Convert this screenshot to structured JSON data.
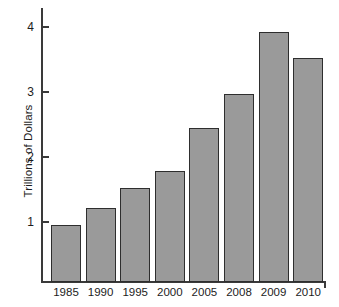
{
  "chart_data": {
    "type": "bar",
    "title": "",
    "subtitle": "",
    "xlabel": "",
    "ylabel": "Trillions of Dollars",
    "categories": [
      "1985",
      "1990",
      "1995",
      "2000",
      "2005",
      "2008",
      "2009",
      "2010"
    ],
    "values": [
      0.95,
      1.22,
      1.52,
      1.78,
      2.45,
      2.97,
      3.92,
      3.52
    ],
    "series": [
      {
        "name": "Trillions of Dollars",
        "values": [
          0.95,
          1.22,
          1.52,
          1.78,
          2.45,
          2.97,
          3.92,
          3.52
        ]
      }
    ],
    "ylim": [
      0.08,
      4.28
    ],
    "y_ticks": [
      1,
      2,
      3,
      4
    ],
    "y_tick_labels": [
      "1",
      "2",
      "3",
      "4"
    ],
    "grid": false,
    "legend": false,
    "legend_position": "none",
    "bar_color": "#9a9a9a",
    "bar_edge_color": "#2e2e2e",
    "axis_color": "#3a3a3a",
    "background_color": "#ffffff"
  }
}
